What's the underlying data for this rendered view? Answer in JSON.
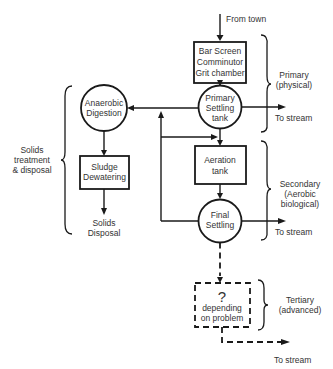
{
  "diagram": {
    "type": "flowchart",
    "input": {
      "label": "From town"
    },
    "nodes": {
      "bar_screen": {
        "shape": "rectangle",
        "lines": [
          "Bar Screen",
          "Comminutor",
          "Grit chamber"
        ]
      },
      "primary_settling": {
        "shape": "circle",
        "lines": [
          "Primary",
          "Settling",
          "tank"
        ]
      },
      "aeration": {
        "shape": "rectangle",
        "lines": [
          "Aeration",
          "tank"
        ]
      },
      "final_settling": {
        "shape": "circle",
        "lines": [
          "Final",
          "Settling"
        ]
      },
      "tertiary": {
        "shape": "dashed-rectangle",
        "symbol": "?",
        "lines": [
          "depending",
          "on problem"
        ]
      },
      "anaerobic": {
        "shape": "circle",
        "lines": [
          "Anaerobic",
          "Digestion"
        ]
      },
      "dewatering": {
        "shape": "rectangle",
        "lines": [
          "Sludge",
          "Dewatering"
        ]
      },
      "solids_disposal": {
        "shape": "text",
        "lines": [
          "Solids",
          "Disposal"
        ]
      }
    },
    "outputs": {
      "primary_to_stream": "To stream",
      "secondary_to_stream": "To stream",
      "tertiary_to_stream": "To stream"
    },
    "stages": {
      "primary": {
        "lines": [
          "Primary",
          "(physical)"
        ]
      },
      "secondary": {
        "lines": [
          "Secondary",
          "(Aerobic",
          "biological)"
        ]
      },
      "tertiary": {
        "lines": [
          "Tertiary",
          "(advanced)"
        ]
      },
      "solids": {
        "lines": [
          "Solids",
          "treatment",
          "& disposal"
        ]
      }
    },
    "edges": [
      {
        "from": "From town",
        "to": "bar_screen"
      },
      {
        "from": "bar_screen",
        "to": "primary_settling"
      },
      {
        "from": "primary_settling",
        "to": "To stream"
      },
      {
        "from": "primary_settling",
        "to": "anaerobic"
      },
      {
        "from": "primary_settling",
        "to": "aeration"
      },
      {
        "from": "aeration",
        "to": "final_settling"
      },
      {
        "from": "final_settling",
        "to": "To stream"
      },
      {
        "from": "final_settling",
        "to": "anaerobic",
        "via": "return sludge line"
      },
      {
        "from": "final_settling",
        "to": "aeration",
        "via": "return sludge line"
      },
      {
        "from": "final_settling",
        "to": "tertiary",
        "style": "dashed"
      },
      {
        "from": "tertiary",
        "to": "To stream",
        "style": "dashed"
      },
      {
        "from": "anaerobic",
        "to": "dewatering"
      },
      {
        "from": "dewatering",
        "to": "solids_disposal"
      }
    ]
  }
}
